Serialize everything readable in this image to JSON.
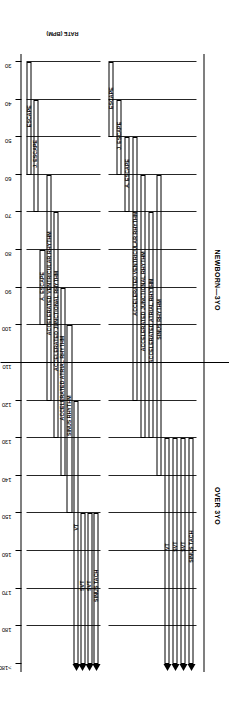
{
  "figure": {
    "axis_title": "RATE (BPM)",
    "groups": [
      {
        "name": "newborn-3yo",
        "label": "NEWBORN—3YO"
      },
      {
        "name": "over-3yo",
        "label": "OVER 3YO"
      }
    ],
    "tick_labels": [
      ">180",
      "180",
      "170",
      "160",
      "150",
      "140",
      "130",
      "120",
      "110",
      "100",
      "90",
      "80",
      "70",
      "60",
      "50",
      "40",
      "30"
    ],
    "tick_values": [
      190,
      180,
      170,
      160,
      150,
      140,
      130,
      120,
      110,
      100,
      90,
      80,
      70,
      60,
      50,
      40,
      30
    ],
    "arrow_marker": "solid-arrowhead",
    "arrow_count": 8
  },
  "chart_data": {
    "type": "bar",
    "title": "",
    "xlabel": "RATE (BPM)",
    "ylabel": "",
    "xlim": [
      30,
      190
    ],
    "grid": true,
    "legend": "none",
    "note": "Horizontal range bars: each cardiac rhythm spans a heart-rate interval in beats per minute. '>180' is an open-ended upper bound marked with a solid arrowhead.",
    "groups": [
      {
        "group": "NEWBORN—3YO",
        "bars": [
          {
            "label": "ESCAPE",
            "start": 30,
            "end": 60
          },
          {
            "label": "J. ESCAPE",
            "start": 40,
            "end": 70
          },
          {
            "label": "A. ESCAPE",
            "start": 80,
            "end": 100
          },
          {
            "label": "ACCELERATED VENTRICULAR RHYTHM",
            "start": 60,
            "end": 120
          },
          {
            "label": "ACCELERATED JUNCTIONAL RHYTHM",
            "start": 70,
            "end": 130
          },
          {
            "label": "ACCELERATED ATRIAL RHYTHM",
            "start": 90,
            "end": 140
          },
          {
            "label": "SINUS RHYTHM",
            "start": 100,
            "end": 150
          },
          {
            "label": "VT",
            "start": 120,
            "end": 190
          },
          {
            "label": "SVT",
            "start": 150,
            "end": 190
          },
          {
            "label": "SVT",
            "start": 150,
            "end": 190
          },
          {
            "label": "SINUS TACH",
            "start": 150,
            "end": 190
          }
        ]
      },
      {
        "group": "OVER 3YO",
        "bars": [
          {
            "label": "ESCAPE",
            "start": 30,
            "end": 50
          },
          {
            "label": "J. ESCAPE",
            "start": 40,
            "end": 60
          },
          {
            "label": "A. ESCAPE",
            "start": 50,
            "end": 70
          },
          {
            "label": "ACCELERATED VENTRICULAR RHYTHM",
            "start": 50,
            "end": 120
          },
          {
            "label": "ACCELERATED JUNCTIONAL RHYTHM",
            "start": 60,
            "end": 130
          },
          {
            "label": "ACCELERATED ATRIAL RHYTHM",
            "start": 70,
            "end": 130
          },
          {
            "label": "SINUS RHYTHM",
            "start": 60,
            "end": 140
          },
          {
            "label": "VT",
            "start": 130,
            "end": 190
          },
          {
            "label": "SVT",
            "start": 130,
            "end": 190
          },
          {
            "label": "SVT",
            "start": 130,
            "end": 190
          },
          {
            "label": "SINUS TACH",
            "start": 130,
            "end": 190
          }
        ]
      }
    ]
  }
}
